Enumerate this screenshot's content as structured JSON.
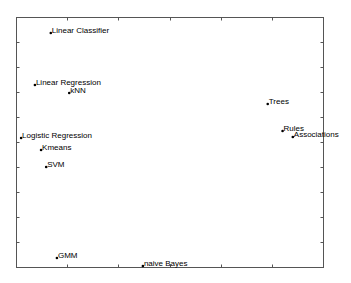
{
  "chart_data": {
    "type": "scatter",
    "title": "",
    "xlabel": "",
    "ylabel": "",
    "xlim": [
      0,
      6
    ],
    "ylim": [
      0,
      10
    ],
    "x_ticks": [
      0,
      1,
      2,
      3,
      4,
      5,
      6
    ],
    "y_ticks": [
      0,
      1,
      2,
      3,
      4,
      5,
      6,
      7,
      8,
      9,
      10
    ],
    "tick_labels_visible": false,
    "grid": false,
    "legend": null,
    "marker_color": "#000000",
    "points": [
      {
        "label": "Linear Classifier",
        "x": 0.68,
        "y": 9.36
      },
      {
        "label": "Linear Regression",
        "x": 0.37,
        "y": 7.28
      },
      {
        "label": "kNN",
        "x": 1.04,
        "y": 6.96
      },
      {
        "label": "Trees",
        "x": 4.92,
        "y": 6.52
      },
      {
        "label": "Rules",
        "x": 5.21,
        "y": 5.44
      },
      {
        "label": "Associations",
        "x": 5.41,
        "y": 5.2
      },
      {
        "label": "Logistic Regression",
        "x": 0.1,
        "y": 5.16
      },
      {
        "label": "Kmeans",
        "x": 0.49,
        "y": 4.68
      },
      {
        "label": "SVM",
        "x": 0.59,
        "y": 4.0
      },
      {
        "label": "GMM",
        "x": 0.8,
        "y": 0.36
      },
      {
        "label": "naive Bayes",
        "x": 2.48,
        "y": 0.04
      }
    ]
  },
  "plot_area": {
    "left": 16,
    "top": 17,
    "right": 323,
    "bottom": 267
  },
  "colors": {
    "axis": "#555555",
    "text": "#000000",
    "background": "#ffffff"
  }
}
